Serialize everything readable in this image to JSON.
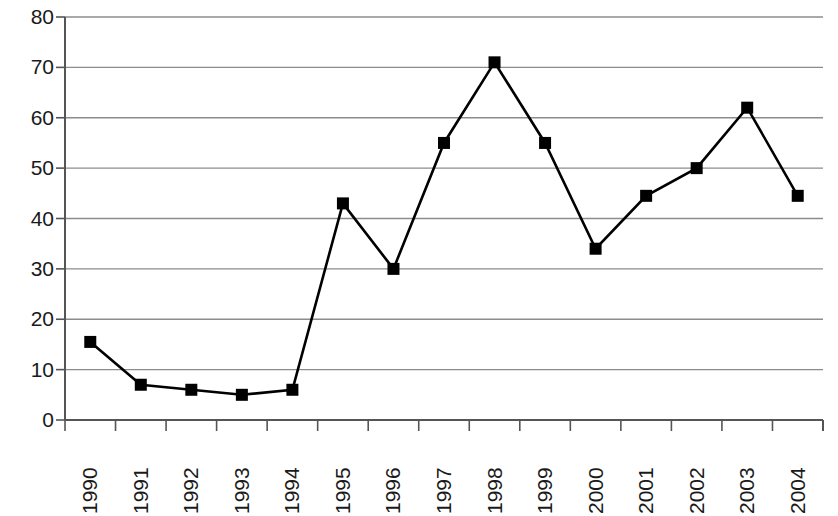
{
  "chart_data": {
    "type": "line",
    "title": "",
    "subtitle": "",
    "xlabel": "",
    "ylabel": "",
    "categories": [
      "1990",
      "1991",
      "1992",
      "1993",
      "1994",
      "1995",
      "1996",
      "1997",
      "1998",
      "1999",
      "2000",
      "2001",
      "2002",
      "2003",
      "2004"
    ],
    "values": [
      15.5,
      7,
      6,
      5,
      6,
      43,
      30,
      55,
      71,
      55,
      34,
      44.5,
      50,
      62,
      44.5
    ],
    "series": [
      {
        "name": "series-1",
        "values": [
          15.5,
          7,
          6,
          5,
          6,
          43,
          30,
          55,
          71,
          55,
          34,
          44.5,
          50,
          62,
          44.5
        ]
      }
    ],
    "ylim": [
      0,
      80
    ],
    "y_ticks": [
      0,
      10,
      20,
      30,
      40,
      50,
      60,
      70,
      80
    ],
    "y_tick_labels": [
      "0",
      "10",
      "20",
      "30",
      "40",
      "50",
      "60",
      "70",
      "80"
    ],
    "x_tick_labels": [
      "1990",
      "1991",
      "1992",
      "1993",
      "1994",
      "1995",
      "1996",
      "1997",
      "1998",
      "1999",
      "2000",
      "2001",
      "2002",
      "2003",
      "2004"
    ],
    "x_tick_rotation": -90,
    "grid": true,
    "grid_axis": "y",
    "legend": false,
    "legend_position": "none",
    "marker": "filled-square",
    "annotations": []
  },
  "style": {
    "line_color": "#000000",
    "marker_color": "#000000",
    "grid_color": "#8c8c8c",
    "axis_color": "#555555",
    "background_color": "#ffffff",
    "text_color": "#1a1a1a"
  }
}
